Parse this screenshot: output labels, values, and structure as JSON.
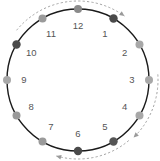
{
  "figure": {
    "background_color": "#ffffff",
    "circle": {
      "center_x": 78,
      "center_y": 80,
      "radius": 71,
      "stroke_color": "#1a1a1a",
      "stroke_width": 1.4
    },
    "label_radius": 54,
    "colors": {
      "dark": "#4a4a4a",
      "mid_dark": "#6b6b6b",
      "mid": "#8a8a8a",
      "light": "#a8a8a8",
      "number_text": "#555555",
      "arrow": "#9a9a9a"
    }
  },
  "hours": [
    {
      "label": "12",
      "angle_deg": 0,
      "dot_color": "#8a8a8a",
      "dot_radius": 4.0
    },
    {
      "label": "1",
      "angle_deg": 30,
      "dot_color": "#4a4a4a",
      "dot_radius": 4.2
    },
    {
      "label": "2",
      "angle_deg": 60,
      "dot_color": "#a8a8a8",
      "dot_radius": 4.0
    },
    {
      "label": "3",
      "angle_deg": 90,
      "dot_color": "#a8a8a8",
      "dot_radius": 4.0
    },
    {
      "label": "4",
      "angle_deg": 120,
      "dot_color": "#a8a8a8",
      "dot_radius": 4.0
    },
    {
      "label": "5",
      "angle_deg": 150,
      "dot_color": "#555555",
      "dot_radius": 4.2
    },
    {
      "label": "6",
      "angle_deg": 180,
      "dot_color": "#4a4a4a",
      "dot_radius": 4.2
    },
    {
      "label": "7",
      "angle_deg": 210,
      "dot_color": "#9a9a9a",
      "dot_radius": 4.0
    },
    {
      "label": "8",
      "angle_deg": 240,
      "dot_color": "#9a9a9a",
      "dot_radius": 4.0
    },
    {
      "label": "9",
      "angle_deg": 270,
      "dot_color": "#a8a8a8",
      "dot_radius": 4.0
    },
    {
      "label": "10",
      "angle_deg": 300,
      "dot_color": "#4a4a4a",
      "dot_radius": 4.2
    },
    {
      "label": "11",
      "angle_deg": 330,
      "dot_color": "#9a9a9a",
      "dot_radius": 4.0
    }
  ],
  "arrows": [
    {
      "name": "top-clockwise-arrow",
      "start_angle_deg": 309,
      "end_angle_deg": 36,
      "radius": 79,
      "head_at": "end",
      "direction": "clockwise"
    },
    {
      "name": "right-clockwise-arrow",
      "start_angle_deg": 86,
      "end_angle_deg": 136,
      "radius": 80,
      "head_at": "end",
      "direction": "clockwise"
    },
    {
      "name": "bottom-clockwise-arrow",
      "start_angle_deg": 140,
      "end_angle_deg": 196,
      "radius": 79,
      "head_at": "end",
      "direction": "clockwise"
    }
  ]
}
